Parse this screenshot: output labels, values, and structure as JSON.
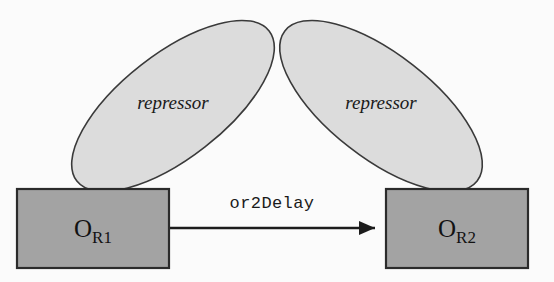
{
  "diagram": {
    "background_color": "#fbfbfb",
    "nodes": [
      {
        "id": "repressor-left",
        "shape": "ellipse",
        "label": "repressor",
        "fill_color": "#dcdcdc",
        "stroke_color": "#3a3a3a",
        "rotation_deg": -38
      },
      {
        "id": "repressor-right",
        "shape": "ellipse",
        "label": "repressor",
        "fill_color": "#dcdcdc",
        "stroke_color": "#3a3a3a",
        "rotation_deg": 38
      },
      {
        "id": "or1",
        "shape": "rectangle",
        "label_base": "O",
        "label_sub": "R1",
        "fill_color": "#a3a3a3",
        "stroke_color": "#2b2b2b"
      },
      {
        "id": "or2",
        "shape": "rectangle",
        "label_base": "O",
        "label_sub": "R2",
        "fill_color": "#a3a3a3",
        "stroke_color": "#2b2b2b"
      }
    ],
    "edges": [
      {
        "id": "or1-to-or2",
        "label": "or2Delay",
        "source": "or1",
        "target": "or2",
        "arrowhead": "solid-triangle",
        "color": "#1c1c1c"
      }
    ]
  }
}
